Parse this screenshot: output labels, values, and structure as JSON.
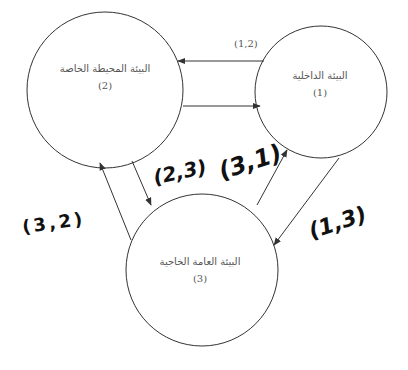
{
  "nodes": [
    {
      "id": "2",
      "title": "البيئة المحيطة الخاصة",
      "number": "(2)"
    },
    {
      "id": "1",
      "title": "البيئة الداخلية",
      "number": "(1)"
    },
    {
      "id": "3",
      "title": "البيئة العامة الخاجية",
      "number": "(3)"
    }
  ],
  "edges": [
    {
      "from": "1",
      "to": "2",
      "label": "(1,2)"
    },
    {
      "from": "2",
      "to": "1",
      "label": ""
    },
    {
      "from": "2",
      "to": "3",
      "label": "(2,3)"
    },
    {
      "from": "3",
      "to": "2",
      "label": "(3,2)"
    },
    {
      "from": "3",
      "to": "1",
      "label": "(3,1)"
    },
    {
      "from": "1",
      "to": "3",
      "label": "(1,3)"
    }
  ],
  "colors": {
    "stroke": "#333333",
    "text": "#555555",
    "handwritten": "#111111"
  }
}
